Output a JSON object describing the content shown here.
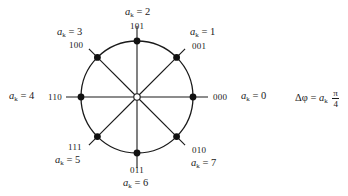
{
  "diagram": {
    "type": "8-PSK constellation",
    "center": {
      "x": 137,
      "y": 97
    },
    "radius": 56,
    "colors": {
      "stroke": "#1a1a1a",
      "dot": "#111111",
      "background": "#ffffff"
    },
    "points": [
      {
        "k": 0,
        "ak_label": "0",
        "code": "000",
        "angle_deg": 0
      },
      {
        "k": 1,
        "ak_label": "1",
        "code": "001",
        "angle_deg": 45
      },
      {
        "k": 2,
        "ak_label": "2",
        "code": "101",
        "angle_deg": 90
      },
      {
        "k": 3,
        "ak_label": "3",
        "code": "100",
        "angle_deg": 135
      },
      {
        "k": 4,
        "ak_label": "4",
        "code": "110",
        "angle_deg": 180
      },
      {
        "k": 5,
        "ak_label": "5",
        "code": "111",
        "angle_deg": 225
      },
      {
        "k": 6,
        "ak_label": "6",
        "code": "011",
        "angle_deg": 270
      },
      {
        "k": 7,
        "ak_label": "7",
        "code": "010",
        "angle_deg": 315
      }
    ],
    "variable": {
      "symbol": "a",
      "subscript": "k",
      "equals": "="
    },
    "formula": {
      "lhs": "Δφ",
      "equals": "=",
      "rhs_symbol": "a",
      "rhs_subscript": "k",
      "numerator": "π",
      "denominator": "4"
    }
  }
}
